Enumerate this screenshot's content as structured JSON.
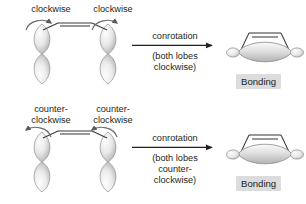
{
  "figure": {
    "background_color": "#ffffff",
    "text_color": "#231f20",
    "orbital_fill_light": "#f2f2f2",
    "orbital_fill_dark": "#b9b9b9",
    "badge_color": "#dcdcdc"
  },
  "rows": [
    {
      "id": "clockwise-row",
      "reactant": {
        "left_rotation_label": "clockwise",
        "right_rotation_label": "clockwise",
        "left_arrow_direction": "clockwise",
        "right_arrow_direction": "clockwise",
        "orbital_count": 2
      },
      "reaction_arrow": {
        "label": "conrotation",
        "sublabel_line1": "(both lobes",
        "sublabel_line2": "clockwise)"
      },
      "product": {
        "overlap_label": "Bonding"
      }
    },
    {
      "id": "counterclockwise-row",
      "reactant": {
        "left_rotation_label": "counter-\nclockwise",
        "right_rotation_label": "counter-\nclockwise",
        "left_arrow_direction": "counterclockwise",
        "right_arrow_direction": "counterclockwise",
        "orbital_count": 2
      },
      "reaction_arrow": {
        "label": "conrotation",
        "sublabel_line1": "(both lobes",
        "sublabel_line2": "counter-",
        "sublabel_line3": "clockwise)"
      },
      "product": {
        "overlap_label": "Bonding"
      }
    }
  ]
}
